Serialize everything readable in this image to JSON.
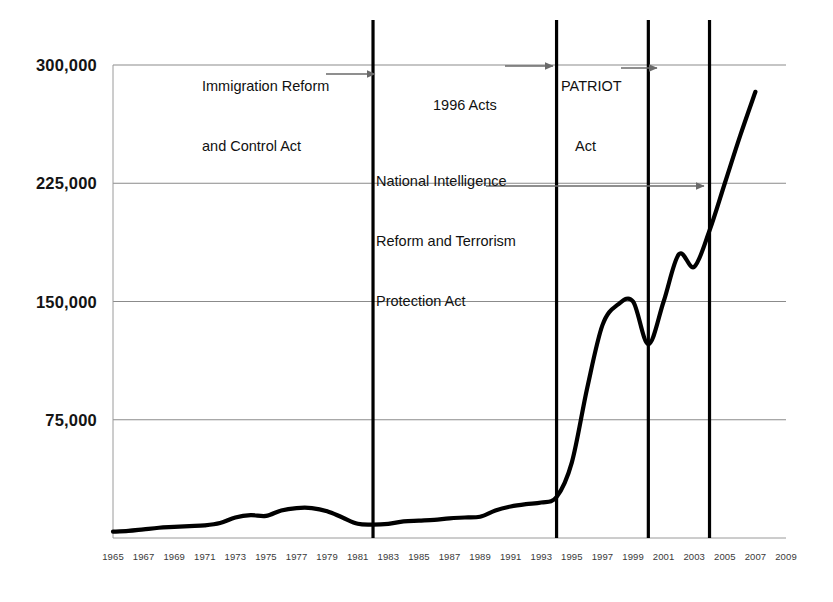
{
  "chart_data": {
    "type": "line",
    "title": "",
    "subtitle": "",
    "xlabel": "",
    "ylabel": "",
    "xlim": [
      1965,
      2009
    ],
    "ylim": [
      0,
      300000
    ],
    "grid": true,
    "legend": false,
    "legend_position": "none",
    "line_color": "#000000",
    "grid_color": "#8b8b8b",
    "y_ticks": [
      "300,000",
      "225,000",
      "150,000",
      "75,000"
    ],
    "y_tick_values": [
      300000,
      225000,
      150000,
      75000
    ],
    "x_ticks": [
      "1965",
      "1967",
      "1969",
      "1971",
      "1973",
      "1975",
      "1977",
      "1979",
      "1981",
      "1983",
      "1985",
      "1987",
      "1989",
      "1991",
      "1993",
      "1995",
      "1997",
      "1999",
      "2001",
      "2003",
      "2005",
      "2007",
      "2009"
    ],
    "x_tick_values": [
      1965,
      1967,
      1969,
      1971,
      1973,
      1975,
      1977,
      1979,
      1981,
      1983,
      1985,
      1987,
      1989,
      1991,
      1993,
      1995,
      1997,
      1999,
      2001,
      2003,
      2005,
      2007,
      2009
    ],
    "series": [
      {
        "name": "Series 1",
        "x": [
          1965,
          1966,
          1967,
          1968,
          1969,
          1970,
          1971,
          1972,
          1973,
          1974,
          1975,
          1976,
          1977,
          1978,
          1979,
          1980,
          1981,
          1982,
          1983,
          1984,
          1985,
          1986,
          1987,
          1988,
          1989,
          1990,
          1991,
          1992,
          1993,
          1994,
          1995,
          1996,
          1997,
          1998,
          1999,
          2000,
          2001,
          2002,
          2003,
          2004,
          2005,
          2006,
          2007
        ],
        "y": [
          4000,
          4500,
          5500,
          6500,
          7000,
          7500,
          8000,
          9500,
          13000,
          14500,
          14000,
          17500,
          19000,
          19000,
          17000,
          13000,
          9000,
          8500,
          9000,
          10500,
          11000,
          11500,
          12500,
          13000,
          13500,
          17500,
          20000,
          21500,
          22500,
          26000,
          48000,
          95000,
          135000,
          148000,
          150000,
          123000,
          150000,
          180000,
          172000,
          195000,
          225000,
          255000,
          283000
        ]
      }
    ],
    "annotations": [
      {
        "id": "immigration-reform-act",
        "text": "Immigration Reform\nand Control Act",
        "arrow": true,
        "target_year": 1982
      },
      {
        "id": "acts-1996",
        "text": "1996 Acts",
        "arrow": true,
        "target_year": 1994
      },
      {
        "id": "patriot-act",
        "text": "PATRIOT\nAct",
        "arrow": true,
        "target_year": 2000
      },
      {
        "id": "national-intelligence-reform-act",
        "text": "National Intelligence\nReform and Terrorism\nProtection Act",
        "arrow": true,
        "target_year": 2004
      }
    ],
    "event_lines": [
      {
        "id": "event-line-1982",
        "year": 1982,
        "label": "Immigration Reform and Control Act"
      },
      {
        "id": "event-line-1994",
        "year": 1994,
        "label": "1996 Acts"
      },
      {
        "id": "event-line-2000",
        "year": 2000,
        "label": "PATRIOT Act"
      },
      {
        "id": "event-line-2004",
        "year": 2004,
        "label": "National Intelligence Reform and Terrorism Protection Act"
      }
    ]
  },
  "annotation_text": {
    "immigration_line1": "Immigration Reform",
    "immigration_line2": "and Control Act",
    "acts_1996": "1996 Acts",
    "patriot_line1": "PATRIOT",
    "patriot_line2": "Act",
    "nirtpa_line1": "National Intelligence",
    "nirtpa_line2": "Reform and Terrorism",
    "nirtpa_line3": "Protection Act"
  }
}
